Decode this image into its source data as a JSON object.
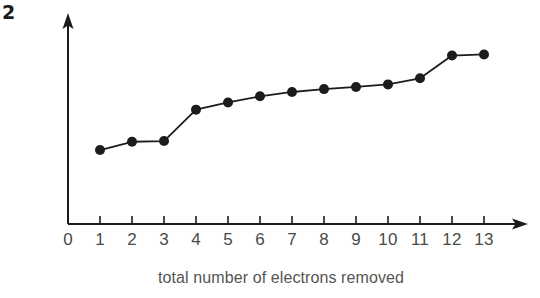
{
  "figure": {
    "number_label": "2",
    "background_color": "#ffffff",
    "ink_color": "#1c1c1c",
    "text_color": "#4a4a4a"
  },
  "chart_data": {
    "type": "line",
    "title": "",
    "subtitle": "",
    "xlabel": "total number of electrons removed",
    "ylabel": "log IE",
    "x": [
      1,
      2,
      3,
      4,
      5,
      6,
      7,
      8,
      9,
      10,
      11,
      12,
      13
    ],
    "values": [
      2.05,
      2.28,
      2.3,
      3.17,
      3.37,
      3.54,
      3.66,
      3.74,
      3.8,
      3.87,
      4.04,
      4.67,
      4.7
    ],
    "xtick_labels": [
      "0",
      "1",
      "2",
      "3",
      "4",
      "5",
      "6",
      "7",
      "8",
      "9",
      "10",
      "11",
      "12",
      "13"
    ],
    "xticks": [
      0,
      1,
      2,
      3,
      4,
      5,
      6,
      7,
      8,
      9,
      10,
      11,
      12,
      13
    ],
    "ytick_labels": [],
    "xlim": [
      0,
      14
    ],
    "ylim": [
      0,
      5.6
    ],
    "grid": false,
    "legend": null,
    "marker": "filled-circle",
    "marker_color": "#1c1c1c",
    "line_color": "#1c1c1c",
    "axis_style": "arrowed-L",
    "annotations": []
  },
  "axes": {
    "x_axis_name": "x-axis-line",
    "y_axis_name": "y-axis-line",
    "x_arrow_name": "x-axis-arrowhead",
    "y_arrow_name": "y-axis-arrowhead"
  }
}
